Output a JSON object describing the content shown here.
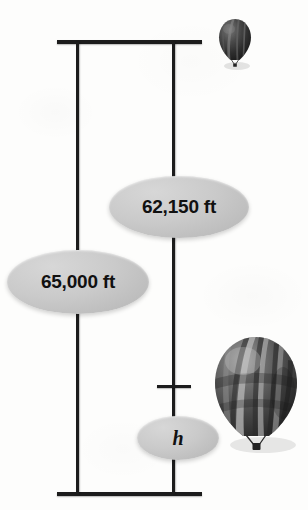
{
  "figure": {
    "background_color": "#fdfdfc",
    "line_color": "#1c1c1c",
    "callout_fill": "#cacaca",
    "callout_text_color": "#111111"
  },
  "callouts": [
    {
      "id": "total-altitude",
      "label": "65,000 ft",
      "name": "callout-65000"
    },
    {
      "id": "upper-distance",
      "label": "62,150 ft",
      "name": "callout-62150"
    },
    {
      "id": "unknown-height",
      "label": "h",
      "name": "callout-h"
    }
  ],
  "rules": {
    "top_rule": "top-horizontal-rule",
    "bottom_rule": "bottom-horizontal-rule",
    "left_vertical": "left-measurement-line",
    "right_vertical": "right-measurement-line",
    "tick": "height-division-tick"
  },
  "balloons": [
    {
      "id": "balloon-upper",
      "name": "hot-air-balloon-small",
      "size": "small"
    },
    {
      "id": "balloon-lower",
      "name": "hot-air-balloon-large",
      "size": "large"
    }
  ]
}
